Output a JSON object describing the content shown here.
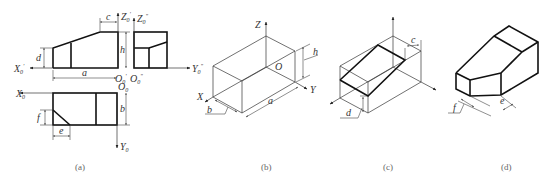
{
  "figure": {
    "panels": [
      {
        "id": "a",
        "caption": "(a)",
        "description": "Orthographic projection: front view, side view and top view with dimensions",
        "labels": {
          "x0_prime": "X",
          "x0_prime_sub": "0",
          "x0_prime_mark": "'",
          "z0_prime": "Z",
          "z0_prime_sub": "0",
          "z0_prime_mark": "'",
          "z0_dprime": "Z",
          "z0_dprime_sub": "0",
          "z0_dprime_mark": "\"",
          "o0_prime": "O",
          "o0_prime_sub": "0",
          "o0_prime_mark": "'",
          "o0_dprime": "O",
          "o0_dprime_sub": "0",
          "o0_dprime_mark": "\"",
          "y0_dprime": "Y",
          "y0_dprime_sub": "0",
          "y0_dprime_mark": "\"",
          "x0": "X",
          "x0_sub": "0",
          "o0": "O",
          "o0_sub": "0",
          "y0": "Y",
          "y0_sub": "0"
        },
        "dimensions": {
          "a": "a",
          "b": "b",
          "c": "c",
          "d": "d",
          "e": "e",
          "f": "f",
          "h": "h"
        }
      },
      {
        "id": "b",
        "caption": "(b)",
        "description": "Isometric bounding box with axes",
        "labels": {
          "x": "X",
          "y": "Y",
          "z": "Z",
          "o": "O"
        },
        "dimensions": {
          "a": "a",
          "b": "b",
          "h": "h"
        }
      },
      {
        "id": "c",
        "caption": "(c)",
        "description": "Isometric box with sloped cut plane",
        "dimensions": {
          "c": "c",
          "d": "d"
        }
      },
      {
        "id": "d",
        "caption": "(d)",
        "description": "Finished isometric drawing of the solid",
        "dimensions": {
          "e": "e",
          "f": "f"
        }
      }
    ]
  }
}
